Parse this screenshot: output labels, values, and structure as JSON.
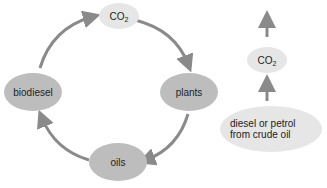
{
  "cycle": {
    "co2": {
      "label": "CO",
      "sub": "2"
    },
    "plants": {
      "label": "plants"
    },
    "oils": {
      "label": "oils"
    },
    "biodiesel": {
      "label": "biodiesel"
    }
  },
  "fossil": {
    "co2": {
      "label": "CO",
      "sub": "2"
    },
    "source": {
      "line1": "diesel or petrol",
      "line2": "from crude oil"
    }
  },
  "colors": {
    "arrow": "#8a8a8a",
    "dark_node": "#bdbdbd",
    "light_node": "#e6e6e6"
  }
}
